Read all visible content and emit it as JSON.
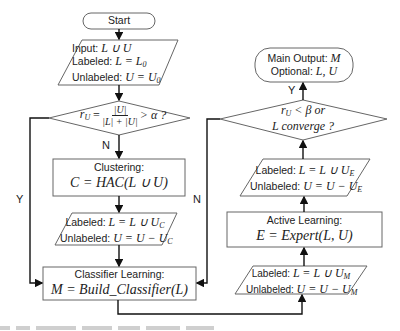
{
  "nodes": {
    "start": {
      "label": "Start"
    },
    "input": {
      "line1_prefix": "Input: ",
      "line1_math": "L ∪ U",
      "line2_prefix": "Labeled: ",
      "line2_math": "L = L",
      "line2_sub": "0",
      "line3_prefix": "Unlabeled: ",
      "line3_math": "U = U",
      "line3_sub": "0"
    },
    "decision1": {
      "math_lhs": "r",
      "math_lhs_sub": "U",
      "eq": " = ",
      "numerator": "|U|",
      "denominator": "|L| + |U|",
      "rhs": " > α ?"
    },
    "clustering": {
      "title": "Clustering:",
      "formula": "C = HAC(L ∪ U)"
    },
    "update_c": {
      "line1_prefix": "Labeled: ",
      "line1_math": "L = L ∪ U",
      "line1_sub": "C",
      "line2_prefix": "Unlabeled: ",
      "line2_math": "U = U − U",
      "line2_sub": "C"
    },
    "classifier": {
      "title": "Classifier Learning:",
      "formula": "M = Build_Classifier(L)"
    },
    "update_m": {
      "line1_prefix": "Labeled: ",
      "line1_math": "L = L ∪ U",
      "line1_sub": "M",
      "line2_prefix": "Unlabeled: ",
      "line2_math": "U = U − U",
      "line2_sub": "M"
    },
    "active": {
      "title": "Active Learning:",
      "formula": "E = Expert(L, U)"
    },
    "update_e": {
      "line1_prefix": "Labeled: ",
      "line1_math": "L = L ∪ U",
      "line1_sub": "E",
      "line2_prefix": "Unlabeled: ",
      "line2_math": "U = U − U",
      "line2_sub": "E"
    },
    "decision2": {
      "line1": "r",
      "line1_sub": "U",
      "line1_rest": " < β or",
      "line2": "L converge ?"
    },
    "output": {
      "line1_prefix": "Main Output: ",
      "line1_math": "M",
      "line2_prefix": "Optional: ",
      "line2_math": "L, U"
    }
  },
  "edge_labels": {
    "d1_no": "N",
    "d1_yes": "Y",
    "d2_no": "N",
    "d2_yes": "Y"
  },
  "colors": {
    "stroke": "#666666",
    "arrow": "#111111",
    "text": "#222222",
    "background": "#ffffff"
  }
}
